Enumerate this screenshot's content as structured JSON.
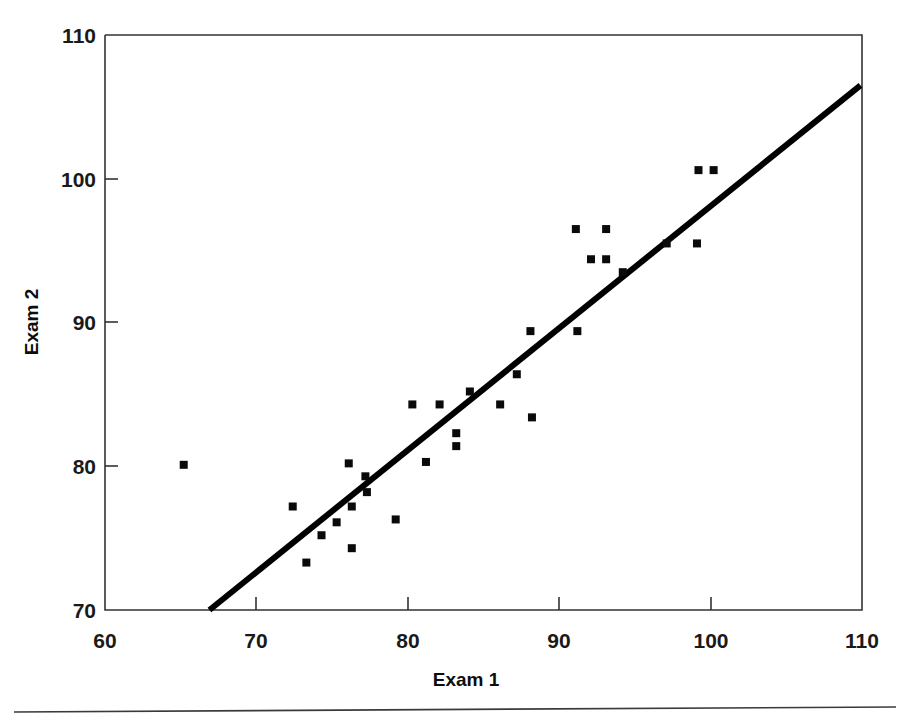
{
  "chart_data": {
    "type": "scatter",
    "title": "",
    "xlabel": "Exam 1",
    "ylabel": "Exam 2",
    "xlim": [
      60,
      110
    ],
    "ylim": [
      70,
      110
    ],
    "xticks": [
      60,
      70,
      80,
      90,
      100,
      110
    ],
    "yticks": [
      70,
      80,
      90,
      100,
      110
    ],
    "xtick_labels": [
      "60",
      "70",
      "80",
      "90",
      "100",
      "110"
    ],
    "ytick_labels": [
      "70",
      "80",
      "90",
      "100",
      "110"
    ],
    "grid": false,
    "legend": null,
    "marker": "square",
    "marker_color": "#0a0a0a",
    "points": [
      {
        "x": 65.2,
        "y": 80.1
      },
      {
        "x": 72.4,
        "y": 77.2
      },
      {
        "x": 73.3,
        "y": 73.3
      },
      {
        "x": 74.3,
        "y": 75.2
      },
      {
        "x": 75.3,
        "y": 76.1
      },
      {
        "x": 76.1,
        "y": 80.2
      },
      {
        "x": 76.3,
        "y": 77.2
      },
      {
        "x": 76.3,
        "y": 74.3
      },
      {
        "x": 77.2,
        "y": 79.3
      },
      {
        "x": 77.3,
        "y": 78.2
      },
      {
        "x": 79.2,
        "y": 76.3
      },
      {
        "x": 80.3,
        "y": 84.3
      },
      {
        "x": 81.2,
        "y": 80.3
      },
      {
        "x": 82.1,
        "y": 84.3
      },
      {
        "x": 83.2,
        "y": 82.3
      },
      {
        "x": 83.2,
        "y": 81.4
      },
      {
        "x": 84.1,
        "y": 85.2
      },
      {
        "x": 86.1,
        "y": 84.3
      },
      {
        "x": 87.2,
        "y": 86.4
      },
      {
        "x": 88.1,
        "y": 89.4
      },
      {
        "x": 88.2,
        "y": 83.4
      },
      {
        "x": 91.1,
        "y": 96.5
      },
      {
        "x": 91.2,
        "y": 89.4
      },
      {
        "x": 92.1,
        "y": 94.4
      },
      {
        "x": 93.1,
        "y": 96.5
      },
      {
        "x": 93.1,
        "y": 94.4
      },
      {
        "x": 94.2,
        "y": 93.5
      },
      {
        "x": 97.1,
        "y": 95.5
      },
      {
        "x": 99.1,
        "y": 95.5
      },
      {
        "x": 99.2,
        "y": 100.6
      },
      {
        "x": 100.2,
        "y": 100.6
      }
    ],
    "trendline": {
      "x0": 66.9,
      "y0": 70.0,
      "x1": 109.9,
      "y1": 106.5
    }
  }
}
